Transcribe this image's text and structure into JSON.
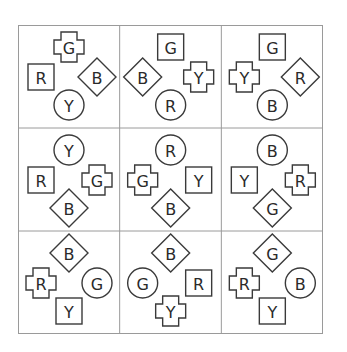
{
  "puzzle": {
    "rows": 3,
    "cols": 3,
    "positions": [
      "top",
      "left",
      "right",
      "bottom"
    ],
    "cells": [
      [
        {
          "top": {
            "shape": "cross",
            "letter": "G"
          },
          "left": {
            "shape": "square",
            "letter": "R"
          },
          "right": {
            "shape": "diamond",
            "letter": "B"
          },
          "bottom": {
            "shape": "circle",
            "letter": "Y"
          }
        },
        {
          "top": {
            "shape": "square",
            "letter": "G"
          },
          "left": {
            "shape": "diamond",
            "letter": "B"
          },
          "right": {
            "shape": "cross",
            "letter": "Y"
          },
          "bottom": {
            "shape": "circle",
            "letter": "R"
          }
        },
        {
          "top": {
            "shape": "square",
            "letter": "G"
          },
          "left": {
            "shape": "cross",
            "letter": "Y"
          },
          "right": {
            "shape": "diamond",
            "letter": "R"
          },
          "bottom": {
            "shape": "circle",
            "letter": "B"
          }
        }
      ],
      [
        {
          "top": {
            "shape": "circle",
            "letter": "Y"
          },
          "left": {
            "shape": "square",
            "letter": "R"
          },
          "right": {
            "shape": "cross",
            "letter": "G"
          },
          "bottom": {
            "shape": "diamond",
            "letter": "B"
          }
        },
        {
          "top": {
            "shape": "circle",
            "letter": "R"
          },
          "left": {
            "shape": "cross",
            "letter": "G"
          },
          "right": {
            "shape": "square",
            "letter": "Y"
          },
          "bottom": {
            "shape": "diamond",
            "letter": "B"
          }
        },
        {
          "top": {
            "shape": "circle",
            "letter": "B"
          },
          "left": {
            "shape": "square",
            "letter": "Y"
          },
          "right": {
            "shape": "cross",
            "letter": "R"
          },
          "bottom": {
            "shape": "diamond",
            "letter": "G"
          }
        }
      ],
      [
        {
          "top": {
            "shape": "diamond",
            "letter": "B"
          },
          "left": {
            "shape": "cross",
            "letter": "R"
          },
          "right": {
            "shape": "circle",
            "letter": "G"
          },
          "bottom": {
            "shape": "square",
            "letter": "Y"
          }
        },
        {
          "top": {
            "shape": "diamond",
            "letter": "B"
          },
          "left": {
            "shape": "circle",
            "letter": "G"
          },
          "right": {
            "shape": "square",
            "letter": "R"
          },
          "bottom": {
            "shape": "cross",
            "letter": "Y"
          }
        },
        {
          "top": {
            "shape": "diamond",
            "letter": "G"
          },
          "left": {
            "shape": "cross",
            "letter": "R"
          },
          "right": {
            "shape": "circle",
            "letter": "B"
          },
          "bottom": {
            "shape": "square",
            "letter": "Y"
          }
        }
      ]
    ],
    "colors": {
      "background": "#ffffff",
      "grid_line": "#9a9a9a",
      "shape_stroke": "#3a3a3a",
      "letter": "#2a2a2a"
    }
  }
}
